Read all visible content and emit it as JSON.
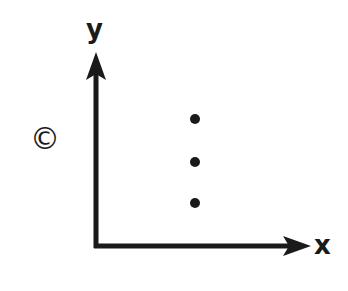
{
  "diagram": {
    "panel_label": "©",
    "axes": {
      "y_label": "y",
      "x_label": "x"
    },
    "points": [
      {
        "x": 195,
        "y": 119
      },
      {
        "x": 195,
        "y": 162
      },
      {
        "x": 195,
        "y": 203
      }
    ],
    "colors": {
      "ink": "#1a1a1a",
      "background": "#ffffff"
    }
  }
}
